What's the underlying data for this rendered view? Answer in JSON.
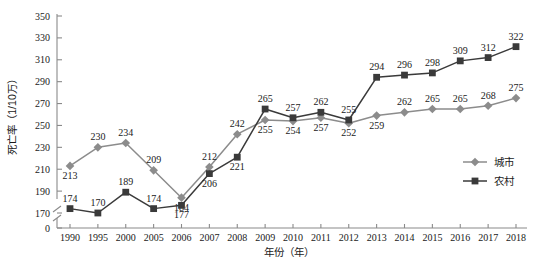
{
  "chart_data": {
    "type": "line",
    "title": "",
    "xlabel": "年份（年）",
    "ylabel": "死亡率（1/10万）",
    "categories": [
      "1990",
      "1995",
      "2000",
      "2005",
      "2006",
      "2007",
      "2008",
      "2009",
      "2010",
      "2011",
      "2012",
      "2013",
      "2014",
      "2015",
      "2016",
      "2017",
      "2018"
    ],
    "series": [
      {
        "name": "城市",
        "marker": "diamond",
        "color": "#8c8c8c",
        "values": [
          213,
          230,
          234,
          209,
          184,
          212,
          242,
          255,
          254,
          257,
          252,
          259,
          262,
          265,
          265,
          268,
          275
        ]
      },
      {
        "name": "农村",
        "marker": "square",
        "color": "#3a3a3a",
        "values": [
          174,
          170,
          189,
          174,
          177,
          206,
          221,
          265,
          257,
          262,
          255,
          294,
          296,
          298,
          309,
          312,
          322
        ]
      }
    ],
    "ylim": [
      170,
      350
    ],
    "yticks": [
      "0",
      "170",
      "190",
      "210",
      "230",
      "250",
      "270",
      "290",
      "310",
      "330",
      "350"
    ],
    "axis_break": true,
    "grid": false,
    "legend_position": "right-middle"
  },
  "legend": {
    "items": [
      {
        "label": "城市"
      },
      {
        "label": "农村"
      }
    ]
  },
  "axes": {
    "y_title": "死亡率（1/10万）",
    "x_title": "年份（年）"
  }
}
